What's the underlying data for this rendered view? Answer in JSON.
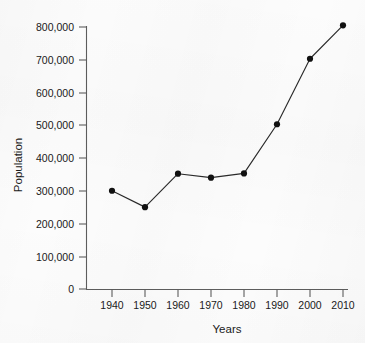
{
  "chart_data": {
    "type": "line",
    "title": "",
    "xlabel": "Years",
    "ylabel": "Population",
    "x": [
      1940,
      1950,
      1960,
      1970,
      1980,
      1990,
      2000,
      2010
    ],
    "values": [
      300000,
      250000,
      352000,
      340000,
      353000,
      503000,
      703000,
      805000
    ],
    "series": [
      {
        "name": "Population",
        "values": [
          300000,
          250000,
          352000,
          340000,
          353000,
          503000,
          703000,
          805000
        ]
      }
    ],
    "categories": [
      "1940",
      "1950",
      "1960",
      "1970",
      "1980",
      "1990",
      "2000",
      "2010"
    ],
    "xtick_labels": [
      "1940",
      "1950",
      "1960",
      "1970",
      "1980",
      "1990",
      "2000",
      "2010"
    ],
    "ytick_labels": [
      "0",
      "100,000",
      "200,000",
      "300,000",
      "400,000",
      "500,000",
      "600,000",
      "700,000",
      "800,000"
    ],
    "ytick_values": [
      0,
      100000,
      200000,
      300000,
      400000,
      500000,
      600000,
      700000,
      800000
    ],
    "xlim": [
      1935,
      2015
    ],
    "ylim": [
      0,
      830000
    ],
    "grid": false,
    "legend": false,
    "legend_position": "none",
    "marker": "filled-circle",
    "line_color": "#2a2a2a",
    "marker_color": "#111111",
    "axis_color": "#5d5d5d",
    "background_color": "#fcfcfc"
  },
  "axes": {
    "y_title": "Population",
    "x_title": "Years"
  }
}
